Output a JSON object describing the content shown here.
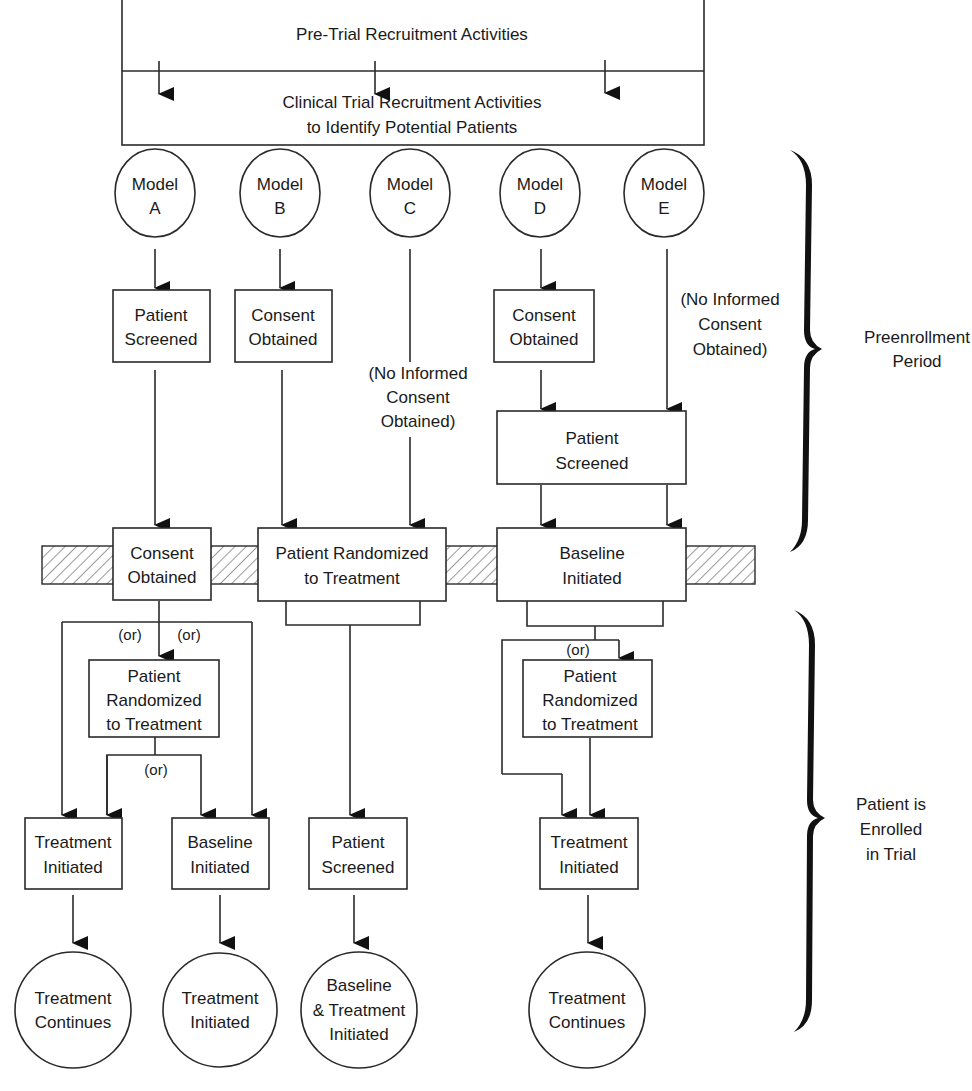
{
  "header": {
    "pre_trial": "Pre-Trial Recruitment Activities",
    "clinical_line1": "Clinical Trial Recruitment Activities",
    "clinical_line2": "to Identify Potential Patients"
  },
  "models": [
    {
      "line1": "Model",
      "line2": "A"
    },
    {
      "line1": "Model",
      "line2": "B"
    },
    {
      "line1": "Model",
      "line2": "C"
    },
    {
      "line1": "Model",
      "line2": "D"
    },
    {
      "line1": "Model",
      "line2": "E"
    }
  ],
  "preenrollment": {
    "a_box": [
      "Patient",
      "Screened"
    ],
    "b_box": [
      "Consent",
      "Obtained"
    ],
    "c_note": [
      "(No Informed",
      "Consent",
      "Obtained)"
    ],
    "d_box": [
      "Consent",
      "Obtained"
    ],
    "e_note": [
      "(No Informed",
      "Consent",
      "Obtained)"
    ],
    "de_box": [
      "Patient",
      "Screened"
    ]
  },
  "enrollment_line": {
    "a_box": [
      "Consent",
      "Obtained"
    ],
    "bc_box": [
      "Patient Randomized",
      "to Treatment"
    ],
    "de_box": [
      "Baseline",
      "Initiated"
    ]
  },
  "enrolled": {
    "or_label": "(or)",
    "a_randomized": [
      "Patient",
      "Randomized",
      "to Treatment"
    ],
    "a_treatment": [
      "Treatment",
      "Initiated"
    ],
    "a_baseline": [
      "Baseline",
      "Initiated"
    ],
    "bc_screened": [
      "Patient",
      "Screened"
    ],
    "de_randomized": [
      "Patient",
      "Randomized",
      "to Treatment"
    ],
    "de_treatment": [
      "Treatment",
      "Initiated"
    ]
  },
  "outcomes": [
    [
      "Treatment",
      "Continues"
    ],
    [
      "Treatment",
      "Initiated"
    ],
    [
      "Baseline",
      "& Treatment",
      "Initiated"
    ],
    [
      "Treatment",
      "Continues"
    ]
  ],
  "braces": {
    "preenrollment": [
      "Preenrollment",
      "Period"
    ],
    "enrolled": [
      "Patient is",
      "Enrolled",
      "in Trial"
    ]
  }
}
